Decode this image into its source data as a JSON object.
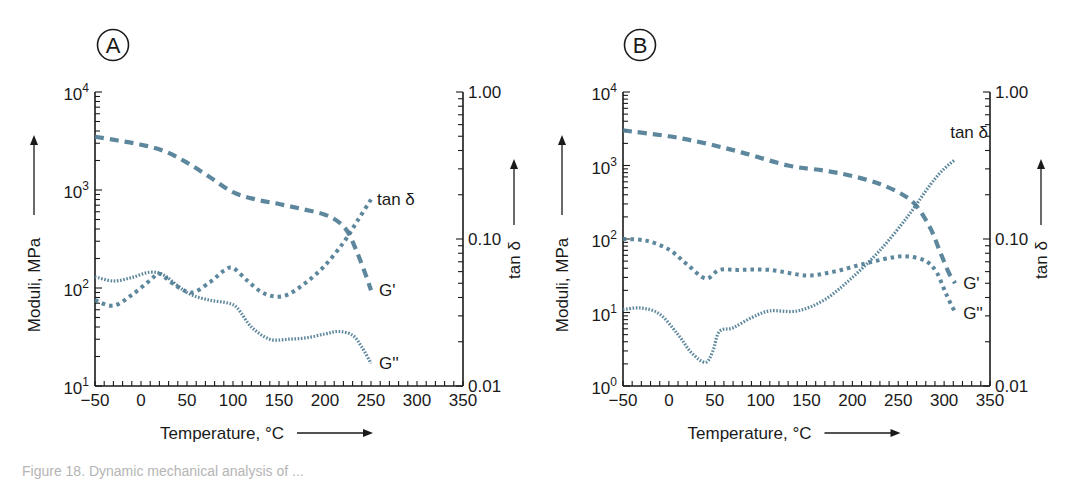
{
  "caption": "Figure 18. Dynamic mechanical analysis of ...",
  "colors": {
    "curve": "#4f7d94",
    "axis": "#1a1a1a"
  },
  "chart_data": [
    {
      "panel": "A",
      "type": "line",
      "xlabel": "Temperature, °C",
      "ylabel": "Moduli, MPa",
      "y2label": "tan δ",
      "xlim": [
        -50,
        350
      ],
      "xticks": [
        -50,
        0,
        50,
        100,
        150,
        200,
        250,
        300,
        350
      ],
      "xtick_labels": [
        "−50",
        "0",
        "50",
        "100",
        "150",
        "200",
        "250",
        "300",
        "350"
      ],
      "ylim": [
        10,
        10000
      ],
      "yscale": "log",
      "yticks": [
        {
          "base": "10",
          "exp": "1",
          "value": 10
        },
        {
          "base": "10",
          "exp": "2",
          "value": 100
        },
        {
          "base": "10",
          "exp": "3",
          "value": 1000
        },
        {
          "base": "10",
          "exp": "4",
          "value": 10000
        }
      ],
      "y2lim": [
        0.01,
        1.0
      ],
      "y2scale": "log",
      "y2ticks": [
        {
          "label": "0.01",
          "value": 0.01
        },
        {
          "label": "0.10",
          "value": 0.1
        },
        {
          "label": "1.00",
          "value": 1.0
        }
      ],
      "grid": false,
      "series": [
        {
          "name": "G'",
          "style": "dashed",
          "axis": "left",
          "x": [
            -50,
            -25,
            0,
            25,
            50,
            75,
            100,
            125,
            150,
            175,
            200,
            215,
            225,
            235,
            245,
            250
          ],
          "y": [
            3500,
            3200,
            2900,
            2500,
            1900,
            1350,
            950,
            800,
            720,
            640,
            560,
            470,
            370,
            230,
            130,
            95
          ]
        },
        {
          "name": "tan δ",
          "style": "dotted-medium",
          "axis": "left",
          "x": [
            -50,
            -30,
            -10,
            10,
            20,
            35,
            55,
            75,
            90,
            100,
            115,
            130,
            145,
            160,
            180,
            200,
            220,
            235,
            250
          ],
          "y": [
            75,
            66,
            85,
            120,
            140,
            110,
            90,
            115,
            150,
            160,
            120,
            92,
            82,
            86,
            115,
            170,
            290,
            480,
            800
          ]
        },
        {
          "name": "G''",
          "style": "dotted-fine",
          "axis": "left",
          "x": [
            -50,
            -30,
            -10,
            10,
            25,
            40,
            55,
            75,
            95,
            105,
            120,
            140,
            160,
            180,
            200,
            215,
            230,
            240,
            250
          ],
          "y": [
            130,
            118,
            128,
            145,
            135,
            105,
            85,
            75,
            70,
            62,
            40,
            30,
            30,
            31,
            34,
            36,
            33,
            25,
            17
          ]
        }
      ],
      "annotations": [
        {
          "text": "tan δ",
          "near_series": "tan δ"
        },
        {
          "text": "G'",
          "near_series": "G'"
        },
        {
          "text": "G''",
          "near_series": "G''"
        }
      ]
    },
    {
      "panel": "B",
      "type": "line",
      "xlabel": "Temperature, °C",
      "ylabel": "Moduli, MPa",
      "y2label": "tan δ",
      "xlim": [
        -50,
        350
      ],
      "xticks": [
        -50,
        0,
        50,
        100,
        150,
        200,
        250,
        300,
        350
      ],
      "xtick_labels": [
        "−50",
        "0",
        "50",
        "100",
        "150",
        "200",
        "250",
        "300",
        "350"
      ],
      "ylim": [
        1,
        10000
      ],
      "yscale": "log",
      "yticks": [
        {
          "base": "10",
          "exp": "0",
          "value": 1
        },
        {
          "base": "10",
          "exp": "1",
          "value": 10
        },
        {
          "base": "10",
          "exp": "2",
          "value": 100
        },
        {
          "base": "10",
          "exp": "3",
          "value": 1000
        },
        {
          "base": "10",
          "exp": "4",
          "value": 10000
        }
      ],
      "y2lim": [
        0.01,
        1.0
      ],
      "y2scale": "log",
      "y2ticks": [
        {
          "label": "0.01",
          "value": 0.01
        },
        {
          "label": "0.10",
          "value": 0.1
        },
        {
          "label": "1.00",
          "value": 1.0
        }
      ],
      "grid": false,
      "series": [
        {
          "name": "G'",
          "style": "dashed",
          "axis": "left",
          "x": [
            -50,
            0,
            40,
            80,
            130,
            170,
            200,
            230,
            255,
            270,
            285,
            295,
            305,
            312
          ],
          "y": [
            3000,
            2500,
            2000,
            1500,
            1000,
            850,
            720,
            560,
            400,
            280,
            140,
            70,
            35,
            25
          ]
        },
        {
          "name": "G''",
          "style": "dotted-medium",
          "axis": "left",
          "x": [
            -50,
            -25,
            0,
            20,
            40,
            55,
            75,
            110,
            150,
            180,
            210,
            240,
            260,
            280,
            292,
            302,
            312
          ],
          "y": [
            100,
            95,
            72,
            45,
            29,
            38,
            38,
            38,
            32,
            36,
            45,
            55,
            58,
            50,
            35,
            18,
            10
          ]
        },
        {
          "name": "tan δ",
          "style": "dotted-fine",
          "axis": "left",
          "x": [
            -50,
            -30,
            -10,
            10,
            25,
            40,
            48,
            55,
            70,
            90,
            110,
            140,
            170,
            200,
            230,
            260,
            285,
            300,
            312
          ],
          "y": [
            11,
            11.5,
            9.5,
            5,
            2.8,
            2.1,
            3,
            5.5,
            6.2,
            8.5,
            10.5,
            10.5,
            15,
            30,
            70,
            200,
            550,
            900,
            1200
          ]
        }
      ],
      "annotations": [
        {
          "text": "tan δ",
          "near_series": "tan δ"
        },
        {
          "text": "G'",
          "near_series": "G'"
        },
        {
          "text": "G''",
          "near_series": "G''"
        }
      ]
    }
  ]
}
